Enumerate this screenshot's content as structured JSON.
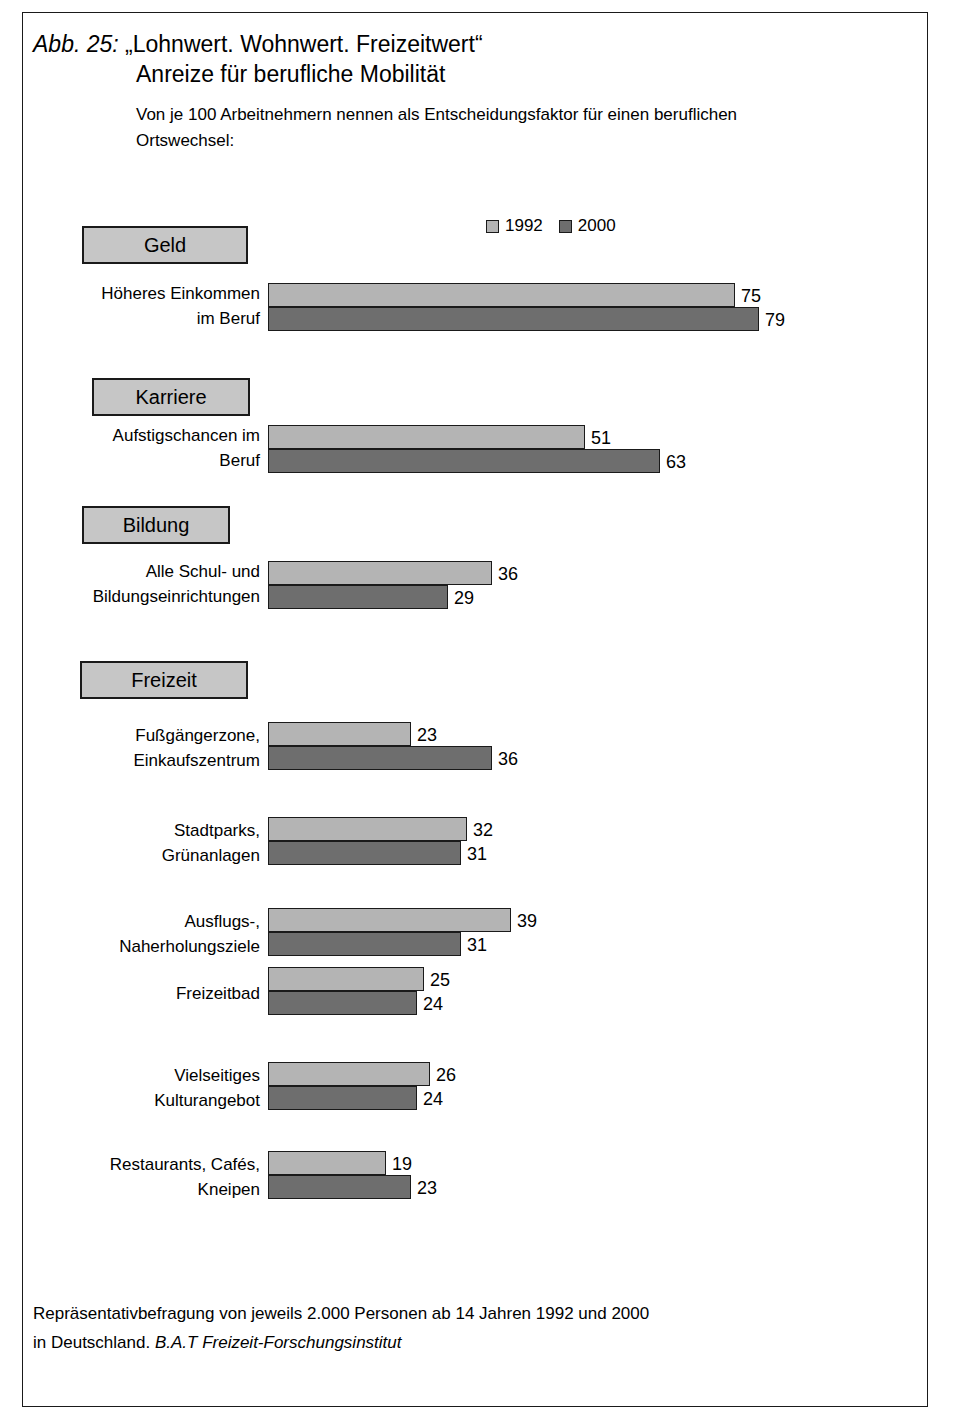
{
  "figure": {
    "number": "Abb. 25:",
    "title_line1": "„Lohnwert. Wohnwert. Freizeitwert“",
    "title_line2": "Anreize für berufliche Mobilität",
    "subtitle": "Von je 100 Arbeitnehmern nennen als Entscheidungsfaktor für einen beruflichen Ortswechsel:",
    "footnote_line1": "Repräsentativbefragung von jeweils 2.000 Personen ab 14 Jahren 1992 und 2000",
    "footnote_line2_plain": "in Deutschland. ",
    "footnote_line2_italic": "B.A.T Freizeit-Forschungsinstitut"
  },
  "legend": {
    "items": [
      {
        "label": "1992",
        "color": "#b4b4b4"
      },
      {
        "label": "2000",
        "color": "#6e6e6e"
      }
    ]
  },
  "chart_data": {
    "type": "bar",
    "orientation": "horizontal",
    "title": "„Lohnwert. Wohnwert. Freizeitwert“ Anreize für berufliche Mobilität",
    "subtitle": "Von je 100 Arbeitnehmern nennen als Entscheidungsfaktor für einen beruflichen Ortswechsel:",
    "xlabel": "",
    "ylabel": "",
    "xlim": [
      0,
      100
    ],
    "grid": false,
    "legend_position": "top-center",
    "unit": "von je 100 Arbeitnehmern",
    "series": [
      {
        "name": "1992",
        "color": "#b4b4b4"
      },
      {
        "name": "2000",
        "color": "#6e6e6e"
      }
    ],
    "groups": [
      {
        "heading": "Geld",
        "categories": [
          {
            "label_line1": "Höheres Einkommen",
            "label_line2": "im Beruf",
            "values": [
              75,
              79
            ]
          }
        ]
      },
      {
        "heading": "Karriere",
        "categories": [
          {
            "label_line1": "Aufstigschancen im",
            "label_line2": "Beruf",
            "values": [
              51,
              63
            ]
          }
        ]
      },
      {
        "heading": "Bildung",
        "categories": [
          {
            "label_line1": "Alle Schul- und",
            "label_line2": "Bildungseinrichtungen",
            "values": [
              36,
              29
            ]
          }
        ]
      },
      {
        "heading": "Freizeit",
        "categories": [
          {
            "label_line1": "Fußgängerzone,",
            "label_line2": "Einkaufszentrum",
            "values": [
              23,
              36
            ]
          },
          {
            "label_line1": "Stadtparks,",
            "label_line2": "Grünanlagen",
            "values": [
              32,
              31
            ]
          },
          {
            "label_line1": "Ausflugs-,",
            "label_line2": "Naherholungsziele",
            "values": [
              39,
              31
            ]
          },
          {
            "label_line1": "Freizeitbad",
            "label_line2": "",
            "values": [
              25,
              24
            ]
          },
          {
            "label_line1": "Vielseitiges",
            "label_line2": "Kulturangebot",
            "values": [
              26,
              24
            ]
          },
          {
            "label_line1": "Restaurants, Cafés,",
            "label_line2": "Kneipen",
            "values": [
              19,
              23
            ]
          }
        ]
      }
    ],
    "categories": [
      "Höheres Einkommen im Beruf",
      "Aufstigschancen im Beruf",
      "Alle Schul- und Bildungseinrichtungen",
      "Fußgängerzone, Einkaufszentrum",
      "Stadtparks, Grünanlagen",
      "Ausflugs-, Naherholungsziele",
      "Freizeitbad",
      "Vielseitiges Kulturangebot",
      "Restaurants, Cafés, Kneipen"
    ],
    "series_values": {
      "1992": [
        75,
        51,
        36,
        23,
        32,
        39,
        25,
        26,
        19
      ],
      "2000": [
        79,
        63,
        29,
        36,
        31,
        31,
        24,
        24,
        23
      ]
    }
  },
  "layout": {
    "bar_origin_x": 268,
    "px_per_unit": 6.22,
    "bar_height": 24,
    "groups": [
      {
        "box": {
          "x": 82,
          "y": 226,
          "w": 166,
          "h": 38
        },
        "rows": [
          {
            "y": 283,
            "label_y": 281
          }
        ]
      },
      {
        "box": {
          "x": 92,
          "y": 378,
          "w": 158,
          "h": 38
        },
        "rows": [
          {
            "y": 425,
            "label_y": 423
          }
        ]
      },
      {
        "box": {
          "x": 82,
          "y": 506,
          "w": 148,
          "h": 38
        },
        "rows": [
          {
            "y": 561,
            "label_y": 559
          }
        ]
      },
      {
        "box": {
          "x": 80,
          "y": 661,
          "w": 168,
          "h": 38
        },
        "rows": [
          {
            "y": 722,
            "label_y": 723
          },
          {
            "y": 817,
            "label_y": 818
          },
          {
            "y": 908,
            "label_y": 909
          },
          {
            "y": 967,
            "label_y": 981
          },
          {
            "y": 1062,
            "label_y": 1063
          },
          {
            "y": 1151,
            "label_y": 1152
          }
        ]
      }
    ]
  }
}
